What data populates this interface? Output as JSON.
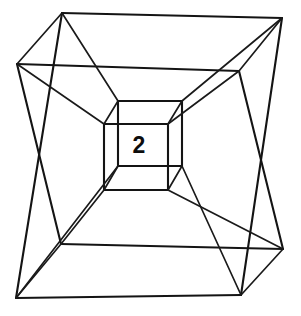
{
  "figure": {
    "type": "line-diagram",
    "background_color": "#ffffff",
    "stroke_color": "#141414",
    "label_color": "#0d0d0d",
    "canvas": {
      "width": 301,
      "height": 316
    },
    "center_label": "2",
    "center_label_position": {
      "x": 139,
      "y": 146
    },
    "vertices": {
      "outer_cube": {
        "description": "Largest outer square frame, slightly rotated",
        "top_left": {
          "x": 62,
          "y": 13
        },
        "top_right": {
          "x": 282,
          "y": 18
        },
        "bottom_right": {
          "x": 241,
          "y": 295
        },
        "bottom_left": {
          "x": 16,
          "y": 298
        }
      },
      "middle_cube": {
        "description": "Intermediate square frame",
        "top_left": {
          "x": 17,
          "y": 64
        },
        "top_right": {
          "x": 239,
          "y": 71
        },
        "bottom_right": {
          "x": 283,
          "y": 249
        },
        "bottom_left": {
          "x": 61,
          "y": 244
        }
      },
      "inner_cube_back": {
        "description": "Inner cube rear face square",
        "top_left": {
          "x": 118,
          "y": 101
        },
        "top_right": {
          "x": 182,
          "y": 101
        },
        "bottom_right": {
          "x": 182,
          "y": 166
        },
        "bottom_left": {
          "x": 118,
          "y": 166
        }
      },
      "inner_cube_front": {
        "description": "Innermost cube front face square containing the label",
        "top_left": {
          "x": 104,
          "y": 124
        },
        "top_right": {
          "x": 168,
          "y": 124
        },
        "bottom_right": {
          "x": 168,
          "y": 190
        },
        "bottom_left": {
          "x": 104,
          "y": 190
        }
      }
    },
    "connector_edges": [
      {
        "from": "outer.top_left",
        "to": "middle.top_left"
      },
      {
        "from": "outer.top_right",
        "to": "middle.top_right"
      },
      {
        "from": "outer.bottom_right",
        "to": "middle.bottom_right"
      },
      {
        "from": "outer.bottom_left",
        "to": "middle.bottom_left"
      },
      {
        "from": "outer.top_left",
        "to": "inner_back.top_left"
      },
      {
        "from": "outer.top_right",
        "to": "inner_back.top_right"
      },
      {
        "from": "outer.bottom_right",
        "to": "inner_back.bottom_right"
      },
      {
        "from": "outer.bottom_left",
        "to": "inner_back.bottom_left"
      },
      {
        "from": "middle.top_left",
        "to": "inner_front.top_left"
      },
      {
        "from": "middle.top_right",
        "to": "inner_front.top_right"
      },
      {
        "from": "middle.bottom_right",
        "to": "inner_front.bottom_right"
      },
      {
        "from": "middle.bottom_left",
        "to": "inner_front.bottom_left"
      }
    ]
  }
}
